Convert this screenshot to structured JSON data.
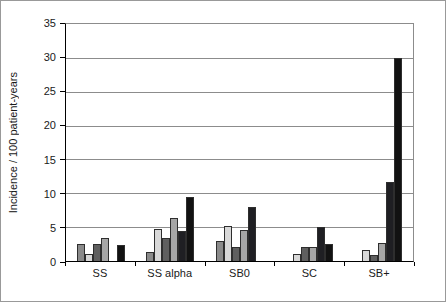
{
  "figure": {
    "background": "#ffffff",
    "frame_color": "#999999",
    "gridline_color": "#8c8c8c",
    "axis_color": "#000000"
  },
  "chart_data": {
    "type": "bar",
    "title": "",
    "xlabel": "",
    "ylabel": "Incidence / 100 patient-years",
    "ylim": [
      0,
      35
    ],
    "ytick_step": 5,
    "ytick_labels": [
      "0",
      "5",
      "10",
      "15",
      "20",
      "25",
      "30",
      "35"
    ],
    "grid": "horizontal",
    "legend": "none",
    "categories": [
      "SS",
      "SS alpha",
      "SB0",
      "SC",
      "SB+"
    ],
    "series": [
      {
        "name": "series-1-medium-gray",
        "color": "#8a8a8a",
        "values": [
          2.5,
          1.3,
          3.0,
          0,
          0
        ]
      },
      {
        "name": "series-2-light-gray",
        "color": "#d8d8d8",
        "values": [
          1.0,
          4.7,
          5.2,
          1.0,
          1.7
        ]
      },
      {
        "name": "series-3-dark-gray",
        "color": "#5f5f5f",
        "values": [
          2.5,
          3.4,
          2.0,
          2.0,
          0.9
        ]
      },
      {
        "name": "series-4-gray",
        "color": "#a6a6a6",
        "values": [
          3.4,
          6.3,
          4.6,
          2.0,
          2.6
        ]
      },
      {
        "name": "series-5-near-black",
        "color": "#1f1f23",
        "values": [
          0,
          4.4,
          8.0,
          5.0,
          11.6
        ]
      },
      {
        "name": "series-6-black",
        "color": "#121212",
        "values": [
          2.3,
          9.4,
          0,
          2.5,
          30.0
        ]
      }
    ]
  }
}
